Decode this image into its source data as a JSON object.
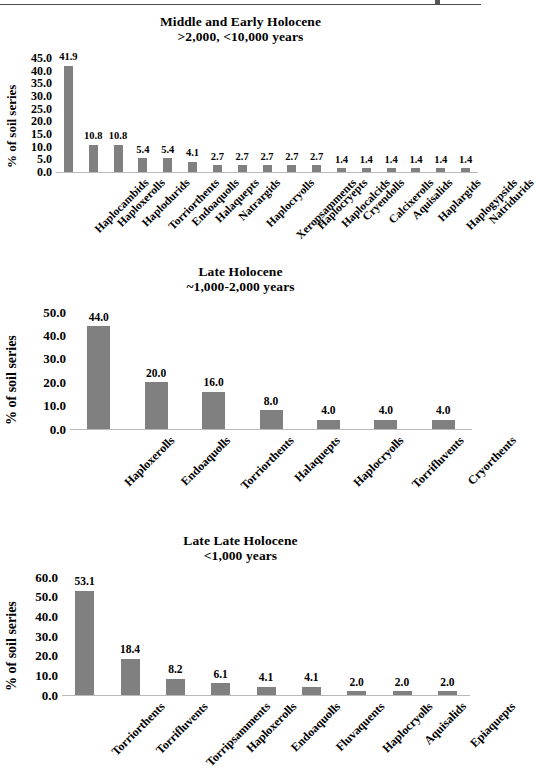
{
  "page": {
    "ylabel": "% of soil series",
    "top_rule": true
  },
  "chart_data": [
    {
      "id": "middle-and-early-holocene",
      "type": "bar",
      "title": "Middle and Early Holocene",
      "subtitle": ">2,000, <10,000 years",
      "xlabel": "",
      "ylabel": "% of soil series",
      "ylim": [
        0,
        45
      ],
      "yticks": [
        "0.0",
        "5.0",
        "10.0",
        "15.0",
        "20.0",
        "25.0",
        "30.0",
        "35.0",
        "40.0",
        "45.0"
      ],
      "grid": false,
      "legend": "none",
      "bar_color": "#808080",
      "categories": [
        "Haplocambids",
        "Haploxerolls",
        "Haplodurids",
        "Torriorthents",
        "Endoaquolls",
        "Halaquepts",
        "Natrargids",
        "Haplocryolls",
        "Xeropsamments",
        "Haplocryepts",
        "Haplocalcids",
        "Cryendolls",
        "Calcixerolls",
        "Aquisalids",
        "Haplargids",
        "Haplogypsids",
        "Natridurids"
      ],
      "values": [
        41.9,
        10.8,
        10.8,
        5.4,
        5.4,
        4.1,
        2.7,
        2.7,
        2.7,
        2.7,
        2.7,
        1.4,
        1.4,
        1.4,
        1.4,
        1.4,
        1.4
      ],
      "value_labels": [
        "41.9",
        "10.8",
        "10.8",
        "5.4",
        "5.4",
        "4.1",
        "2.7",
        "2.7",
        "2.7",
        "2.7",
        "2.7",
        "1.4",
        "1.4",
        "1.4",
        "1.4",
        "1.4",
        "1.4"
      ]
    },
    {
      "id": "late-holocene",
      "type": "bar",
      "title": "Late Holocene",
      "subtitle": "~1,000-2,000 years",
      "xlabel": "",
      "ylabel": "% of soil series",
      "ylim": [
        0,
        50
      ],
      "yticks": [
        "0.0",
        "10.0",
        "20.0",
        "30.0",
        "40.0",
        "50.0"
      ],
      "grid": false,
      "legend": "none",
      "bar_color": "#808080",
      "categories": [
        "Haploxerolls",
        "Endoaquolls",
        "Torriorthents",
        "Halaquepts",
        "Haplocryolls",
        "Torrifluvents",
        "Cryorthents"
      ],
      "values": [
        44.0,
        20.0,
        16.0,
        8.0,
        4.0,
        4.0,
        4.0
      ],
      "value_labels": [
        "44.0",
        "20.0",
        "16.0",
        "8.0",
        "4.0",
        "4.0",
        "4.0"
      ]
    },
    {
      "id": "late-late-holocene",
      "type": "bar",
      "title": "Late Late Holocene",
      "subtitle": "<1,000 years",
      "xlabel": "",
      "ylabel": "% of soil series",
      "ylim": [
        0,
        60
      ],
      "yticks": [
        "0.0",
        "10.0",
        "20.0",
        "30.0",
        "40.0",
        "50.0",
        "60.0"
      ],
      "grid": false,
      "legend": "none",
      "bar_color": "#808080",
      "categories": [
        "Torriorthents",
        "Torrifluvents",
        "Torripsamments",
        "Haploxerolls",
        "Endoaquolls",
        "Fluvaquents",
        "Haplocryolls",
        "Aquisalids",
        "Epiaquepts"
      ],
      "values": [
        53.1,
        18.4,
        8.2,
        6.1,
        4.1,
        4.1,
        2.0,
        2.0,
        2.0
      ],
      "value_labels": [
        "53.1",
        "18.4",
        "8.2",
        "6.1",
        "4.1",
        "4.1",
        "2.0",
        "2.0",
        "2.0"
      ]
    }
  ]
}
